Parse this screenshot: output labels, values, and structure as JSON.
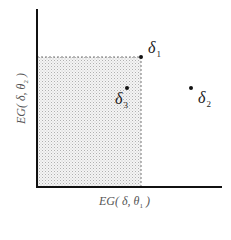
{
  "diagram": {
    "x_axis_label": {
      "prefix": "EG( ",
      "delta": "δ",
      "sep": ", ",
      "theta": "θ",
      "sub": "1",
      "suffix": " )"
    },
    "y_axis_label": {
      "prefix": "EG( ",
      "delta": "δ",
      "sep": ", ",
      "theta": "θ",
      "sub": "2",
      "suffix": " )"
    },
    "points": [
      {
        "id": "delta1",
        "symbol": "δ",
        "sub": "1"
      },
      {
        "id": "delta2",
        "symbol": "δ",
        "sub": "2"
      },
      {
        "id": "delta3",
        "symbol": "δ",
        "sub": "3"
      }
    ],
    "shaded_region": "dominated-region-of-delta1",
    "colors": {
      "axis": "#111111",
      "point": "#111111",
      "shade": "#bdbdbd",
      "dash": "#777777"
    }
  }
}
